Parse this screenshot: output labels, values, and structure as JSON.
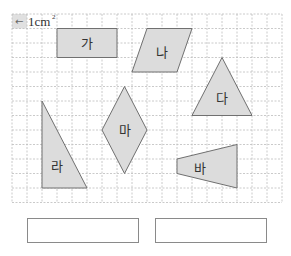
{
  "grid": {
    "cols": 18,
    "rows": 13,
    "x0": 12,
    "y0": 14,
    "cell_w": 15,
    "cell_h": 14.5,
    "line_color": "#bdbdbd"
  },
  "unit_label": {
    "arrow": "←",
    "text": "1cm",
    "sup": "2"
  },
  "colors": {
    "shape_fill": "#dcdcdc",
    "shape_stroke": "#707070",
    "unit_cell_fill": "#e0e0e0",
    "box_border": "#8a8a8a"
  },
  "shapes": [
    {
      "label": "가",
      "name": "rectangle",
      "points": [
        [
          3,
          1
        ],
        [
          7,
          1
        ],
        [
          7,
          3
        ],
        [
          3,
          3
        ]
      ],
      "label_pos": [
        5,
        2
      ]
    },
    {
      "label": "나",
      "name": "parallelogram",
      "points": [
        [
          9,
          1
        ],
        [
          12,
          1
        ],
        [
          11,
          4
        ],
        [
          8,
          4
        ]
      ],
      "label_pos": [
        10,
        2.6
      ]
    },
    {
      "label": "다",
      "name": "triangle",
      "points": [
        [
          14,
          3
        ],
        [
          16,
          7
        ],
        [
          12,
          7
        ]
      ],
      "label_pos": [
        14,
        5.8
      ]
    },
    {
      "label": "라",
      "name": "right-triangle",
      "points": [
        [
          2,
          6
        ],
        [
          5,
          12
        ],
        [
          2,
          12
        ]
      ],
      "label_pos": [
        3,
        10.5
      ]
    },
    {
      "label": "마",
      "name": "rhombus",
      "points": [
        [
          7.5,
          5
        ],
        [
          9,
          8
        ],
        [
          7.5,
          11
        ],
        [
          6,
          8
        ]
      ],
      "label_pos": [
        7.5,
        8
      ]
    },
    {
      "label": "바",
      "name": "trapezoid",
      "points": [
        [
          11,
          10
        ],
        [
          15,
          9
        ],
        [
          15,
          12
        ],
        [
          11,
          11
        ]
      ],
      "label_pos": [
        12.5,
        10.6
      ]
    }
  ],
  "answer_boxes": [
    {
      "x": 27,
      "y": 218,
      "w": 112,
      "h": 25,
      "value": ""
    },
    {
      "x": 155,
      "y": 218,
      "w": 112,
      "h": 25,
      "value": ""
    }
  ]
}
